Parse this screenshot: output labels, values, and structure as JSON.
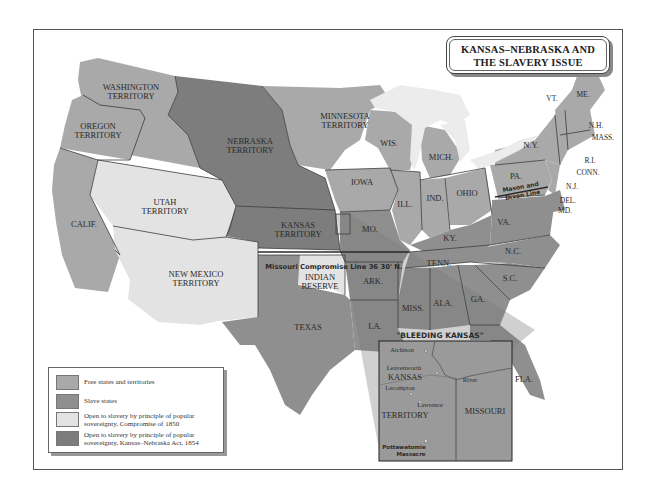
{
  "title": {
    "line1": "KANSAS–NEBRASKA AND",
    "line2": "THE SLAVERY ISSUE"
  },
  "colors": {
    "free": "#a9a9a9",
    "slave": "#8f8f8f",
    "compromise_1850": "#e3e3e3",
    "kansas_nebraska_1854": "#7d7d7d",
    "lakes": "#ececec",
    "border": "#3c3c3c"
  },
  "legend": {
    "items": [
      {
        "key": "free",
        "label": "Free states and territories"
      },
      {
        "key": "slave",
        "label": "Slave states"
      },
      {
        "key": "compromise_1850",
        "label_line1": "Open to slavery by principle of popular",
        "label_line2": "sovereignty, Compromise of 1850"
      },
      {
        "key": "kansas_nebraska_1854",
        "label_line1": "Open to slavery by principle of popular",
        "label_line2": "sovereignty, Kansas–Nebraska Act, 1854"
      }
    ]
  },
  "regions": {
    "washington": {
      "line1": "WASHINGTON",
      "line2": "TERRITORY",
      "status": "free"
    },
    "oregon": {
      "line1": "OREGON",
      "line2": "TERRITORY",
      "status": "free"
    },
    "california": {
      "label": "CALIF.",
      "status": "free"
    },
    "utah": {
      "line1": "UTAH",
      "line2": "TERRITORY",
      "status": "compromise_1850"
    },
    "new_mexico": {
      "line1": "NEW MEXICO",
      "line2": "TERRITORY",
      "status": "compromise_1850"
    },
    "nebraska": {
      "line1": "NEBRASKA",
      "line2": "TERRITORY",
      "status": "kansas_nebraska_1854"
    },
    "kansas": {
      "line1": "KANSAS",
      "line2": "TERRITORY",
      "status": "kansas_nebraska_1854"
    },
    "minnesota": {
      "line1": "MINNESOTA",
      "line2": "TERRITORY",
      "status": "free"
    },
    "indian_reserve": {
      "line1": "INDIAN",
      "line2": "RESERVE",
      "status": "compromise_1850"
    },
    "texas": {
      "label": "TEXAS",
      "status": "slave"
    },
    "iowa": {
      "label": "IOWA",
      "status": "free"
    },
    "wisconsin": {
      "label": "WIS.",
      "status": "free"
    },
    "michigan": {
      "label": "MICH.",
      "status": "free"
    },
    "illinois": {
      "label": "ILL.",
      "status": "free"
    },
    "indiana": {
      "label": "IND.",
      "status": "free"
    },
    "ohio": {
      "label": "OHIO",
      "status": "free"
    },
    "pennsylvania": {
      "label": "PA.",
      "status": "free"
    },
    "new_york": {
      "label": "N.Y.",
      "status": "free"
    },
    "vermont": {
      "label": "VT.",
      "status": "free"
    },
    "maine": {
      "label": "ME.",
      "status": "free"
    },
    "new_hampshire": {
      "label": "N.H.",
      "status": "free"
    },
    "massachusetts": {
      "label": "MASS.",
      "status": "free"
    },
    "rhode_island": {
      "label": "R.I.",
      "status": "free"
    },
    "connecticut": {
      "label": "CONN.",
      "status": "free"
    },
    "new_jersey": {
      "label": "N.J.",
      "status": "free"
    },
    "delaware": {
      "label": "DEL.",
      "status": "slave"
    },
    "maryland": {
      "label": "MD.",
      "status": "slave"
    },
    "missouri": {
      "label": "MO.",
      "status": "slave"
    },
    "kentucky": {
      "label": "KY.",
      "status": "slave"
    },
    "virginia": {
      "label": "VA.",
      "status": "slave"
    },
    "north_carolina": {
      "label": "N.C.",
      "status": "slave"
    },
    "tennessee": {
      "label": "TENN.",
      "status": "slave"
    },
    "south_carolina": {
      "label": "S.C.",
      "status": "slave"
    },
    "arkansas": {
      "label": "ARK.",
      "status": "slave"
    },
    "mississippi": {
      "label": "MISS.",
      "status": "slave"
    },
    "alabama": {
      "label": "ALA.",
      "status": "slave"
    },
    "georgia": {
      "label": "GA.",
      "status": "slave"
    },
    "louisiana": {
      "label": "LA.",
      "status": "slave"
    },
    "florida": {
      "label": "FLA.",
      "status": "slave"
    }
  },
  "lines": {
    "missouri_compromise": "Missouri Compromise Line 36 30' N.",
    "mason_dixon_line1": "Mason and",
    "mason_dixon_line2": "Dixon Line"
  },
  "inset": {
    "title": "\"BLEEDING KANSAS\"",
    "kansas_line1": "KANSAS",
    "kansas_line2": "TERRITORY",
    "missouri": "MISSOURI",
    "river": "River",
    "places": [
      {
        "name": "Atchison"
      },
      {
        "name": "Leavenworth"
      },
      {
        "name": "Lecompton"
      },
      {
        "name": "Lawrence"
      }
    ],
    "massacre_line1": "Pottawatomie",
    "massacre_line2": "Massacre"
  }
}
